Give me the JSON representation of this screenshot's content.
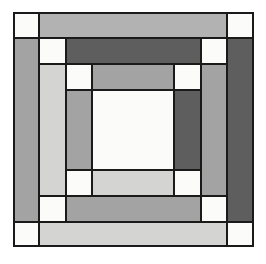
{
  "artwork": {
    "title": "Log Cabin Quilt Block",
    "pattern_name": "Courthouse Steps",
    "background_color": "#ffffff",
    "outline_color": "#1a1a1a",
    "outline_width_px": 2,
    "canvas": {
      "width": 266,
      "height": 264
    },
    "block_bounds": {
      "x": 13,
      "y": 12,
      "width": 241,
      "height": 235
    },
    "palette": {
      "white": "#fbfbfa",
      "light_gray": "#d4d4d2",
      "medium_light_gray": "#b2b2b2",
      "medium_gray": "#a3a3a3",
      "dark_gray": "#5e5e5e",
      "charcoal": "#585858"
    },
    "grid": {
      "x_lines": [
        13,
        39,
        66,
        92,
        148,
        174,
        201,
        227,
        254
      ],
      "y_lines": [
        12,
        38,
        64,
        90,
        170,
        196,
        222,
        247
      ]
    },
    "rings": [
      {
        "name": "ring-1-outer",
        "colors": [
          "#fbfbfa",
          "#b2b2b2",
          "#a3a3a3",
          "#d4d4d2"
        ]
      },
      {
        "name": "ring-2",
        "colors": [
          "#fbfbfa",
          "#5e5e5e",
          "#b2b2b2",
          "#a3a3a3"
        ]
      },
      {
        "name": "ring-3",
        "colors": [
          "#fbfbfa",
          "#b2b2b2",
          "#d4d4d2",
          "#b2b2b2"
        ]
      },
      {
        "name": "ring-4-inner",
        "colors": [
          "#fbfbfa",
          "#5e5e5e",
          "#a3a3a3",
          "#d4d4d2"
        ]
      },
      {
        "name": "center",
        "colors": [
          "#fbfbfa"
        ]
      }
    ],
    "patches": [
      {
        "name": "patch-corner-top-left",
        "x": 13,
        "y": 12,
        "w": 26,
        "h": 26,
        "color": "#fbfbfa"
      },
      {
        "name": "patch-top-bar",
        "x": 39,
        "y": 12,
        "w": 188,
        "h": 26,
        "color": "#b2b2b2"
      },
      {
        "name": "patch-corner-top-right",
        "x": 227,
        "y": 12,
        "w": 27,
        "h": 26,
        "color": "#fbfbfa"
      },
      {
        "name": "patch-left-bar",
        "x": 13,
        "y": 38,
        "w": 26,
        "h": 184,
        "color": "#a3a3a3"
      },
      {
        "name": "patch-right-bar",
        "x": 227,
        "y": 38,
        "w": 27,
        "h": 184,
        "color": "#5e5e5e"
      },
      {
        "name": "patch-corner-bottom-left",
        "x": 13,
        "y": 222,
        "w": 26,
        "h": 25,
        "color": "#fbfbfa"
      },
      {
        "name": "patch-bottom-bar",
        "x": 39,
        "y": 222,
        "w": 188,
        "h": 25,
        "color": "#d4d4d2"
      },
      {
        "name": "patch-corner-bottom-right",
        "x": 227,
        "y": 222,
        "w": 27,
        "h": 25,
        "color": "#fbfbfa"
      },
      {
        "name": "patch-r2-corner-top-left",
        "x": 39,
        "y": 38,
        "w": 27,
        "h": 26,
        "color": "#fbfbfa"
      },
      {
        "name": "patch-r2-top-bar",
        "x": 66,
        "y": 38,
        "w": 135,
        "h": 26,
        "color": "#5e5e5e"
      },
      {
        "name": "patch-r2-corner-top-right",
        "x": 201,
        "y": 38,
        "w": 26,
        "h": 26,
        "color": "#fbfbfa"
      },
      {
        "name": "patch-r2-left-bar",
        "x": 39,
        "y": 64,
        "w": 27,
        "h": 132,
        "color": "#d4d4d2"
      },
      {
        "name": "patch-r2-right-bar",
        "x": 201,
        "y": 64,
        "w": 26,
        "h": 132,
        "color": "#a3a3a3"
      },
      {
        "name": "patch-r2-corner-bottom-left",
        "x": 39,
        "y": 196,
        "w": 27,
        "h": 26,
        "color": "#fbfbfa"
      },
      {
        "name": "patch-r2-bottom-bar",
        "x": 66,
        "y": 196,
        "w": 135,
        "h": 26,
        "color": "#a3a3a3"
      },
      {
        "name": "patch-r2-corner-bottom-right",
        "x": 201,
        "y": 196,
        "w": 26,
        "h": 26,
        "color": "#fbfbfa"
      },
      {
        "name": "patch-r3-corner-top-left",
        "x": 66,
        "y": 64,
        "w": 26,
        "h": 26,
        "color": "#fbfbfa"
      },
      {
        "name": "patch-r3-top-bar",
        "x": 92,
        "y": 64,
        "w": 82,
        "h": 26,
        "color": "#a3a3a3"
      },
      {
        "name": "patch-r3-corner-top-right",
        "x": 174,
        "y": 64,
        "w": 27,
        "h": 26,
        "color": "#fbfbfa"
      },
      {
        "name": "patch-r3-left-bar",
        "x": 66,
        "y": 90,
        "w": 26,
        "h": 80,
        "color": "#a3a3a3"
      },
      {
        "name": "patch-r3-right-bar",
        "x": 174,
        "y": 90,
        "w": 27,
        "h": 80,
        "color": "#5e5e5e"
      },
      {
        "name": "patch-r3-corner-bottom-left",
        "x": 66,
        "y": 170,
        "w": 26,
        "h": 26,
        "color": "#fbfbfa"
      },
      {
        "name": "patch-r3-bottom-bar",
        "x": 92,
        "y": 170,
        "w": 82,
        "h": 26,
        "color": "#d4d4d2"
      },
      {
        "name": "patch-r3-corner-bottom-right",
        "x": 174,
        "y": 170,
        "w": 27,
        "h": 26,
        "color": "#fbfbfa"
      },
      {
        "name": "patch-center",
        "x": 92,
        "y": 90,
        "w": 82,
        "h": 80,
        "color": "#fbfbfa"
      }
    ]
  }
}
